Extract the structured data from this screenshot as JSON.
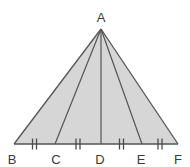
{
  "figure": {
    "name": "triangle-with-equal-base-divisions",
    "background_color": "#ffffff",
    "fill_color": "#d6d6d6",
    "stroke_color": "#555555",
    "label_color": "#3a3a3a",
    "tick_color": "#4a4a4a"
  },
  "labels": {
    "apex": "A",
    "base_left": "B",
    "base_c": "C",
    "base_d": "D",
    "base_e": "E",
    "base_right": "F"
  },
  "points": {
    "A": {
      "x": 101,
      "y": 29
    },
    "B": {
      "x": 14,
      "y": 144
    },
    "C": {
      "x": 55,
      "y": 144
    },
    "D": {
      "x": 101,
      "y": 144
    },
    "E": {
      "x": 142,
      "y": 144
    },
    "F": {
      "x": 178,
      "y": 144
    }
  },
  "label_positions": {
    "A": {
      "x": 101,
      "y": 17
    },
    "B": {
      "x": 14,
      "y": 163
    },
    "C": {
      "x": 55,
      "y": 163
    },
    "D": {
      "x": 101,
      "y": 163
    },
    "E": {
      "x": 142,
      "y": 163
    },
    "F": {
      "x": 178,
      "y": 163
    }
  },
  "segments": [
    {
      "name": "side-AB",
      "from": "A",
      "to": "B"
    },
    {
      "name": "side-AF",
      "from": "A",
      "to": "F"
    },
    {
      "name": "base-BF",
      "from": "B",
      "to": "F"
    },
    {
      "name": "cevian-AC",
      "from": "A",
      "to": "C"
    },
    {
      "name": "cevian-AD",
      "from": "A",
      "to": "D"
    },
    {
      "name": "cevian-AE",
      "from": "A",
      "to": "E"
    }
  ],
  "tick_marks": [
    {
      "name": "tick-BC",
      "segment": "BC",
      "center_x": 34.5,
      "count": 2
    },
    {
      "name": "tick-CD",
      "segment": "CD",
      "center_x": 78,
      "count": 2
    },
    {
      "name": "tick-DE",
      "segment": "DE",
      "center_x": 121.5,
      "count": 2
    },
    {
      "name": "tick-EF",
      "segment": "EF",
      "center_x": 160,
      "count": 2
    }
  ],
  "annotations": {
    "tick_count_per_segment": "2",
    "equal_segments": "BC = CD = DE = EF"
  }
}
